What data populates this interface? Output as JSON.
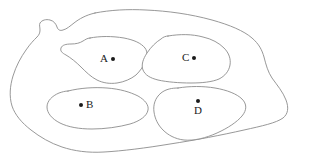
{
  "figure": {
    "type": "region-map-diagram",
    "title": "",
    "background_color": "#ffffff",
    "line_color": "#8c8c8c",
    "label_color": "#1a1a1a",
    "dot_color": "#1a1a1a",
    "width": 311,
    "height": 167
  },
  "outer_boundary": {
    "name": "outer-region-outline",
    "label": ""
  },
  "regions": [
    {
      "id": "A",
      "label": "A",
      "dot_x": 114,
      "dot_y": 59,
      "label_position": "left"
    },
    {
      "id": "B",
      "label": "B",
      "dot_x": 81,
      "dot_y": 105,
      "label_position": "right"
    },
    {
      "id": "C",
      "label": "C",
      "dot_x": 195,
      "dot_y": 58,
      "label_position": "left"
    },
    {
      "id": "D",
      "label": "D",
      "dot_x": 198,
      "dot_y": 103,
      "label_position": "below"
    }
  ]
}
